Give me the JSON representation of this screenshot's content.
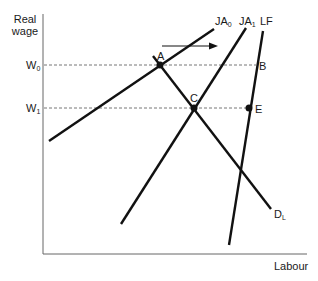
{
  "diagram": {
    "y_axis_label_line1": "Real",
    "y_axis_label_line2": "wage",
    "x_axis_label": "Labour",
    "wage_levels": [
      {
        "base": "W",
        "sub": "0"
      },
      {
        "base": "W",
        "sub": "1"
      }
    ],
    "curves": {
      "ja0": {
        "base": "JA",
        "sub": "0"
      },
      "ja1": {
        "base": "JA",
        "sub": "1"
      },
      "lf": {
        "base": "LF",
        "sub": ""
      },
      "dl": {
        "base": "D",
        "sub": "L"
      }
    },
    "points": {
      "a": "A",
      "b": "B",
      "c": "C",
      "e": "E"
    },
    "colors": {
      "line": "#111111",
      "axis": "#555555",
      "dashed": "#777777"
    }
  }
}
